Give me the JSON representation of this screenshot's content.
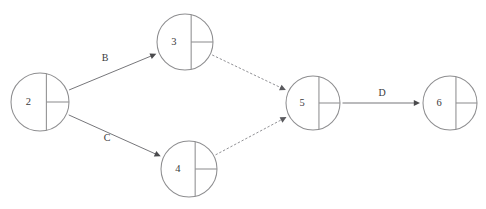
{
  "diagram": {
    "background_color": "#ffffff",
    "node_stroke_color": "#8e8e90",
    "edge_solid_color": "#6f6f73",
    "edge_dashed_color": "#8b8b8f",
    "label_color": "#3a3a3c",
    "nodes": [
      {
        "id": "2",
        "label": "2",
        "cx": 40,
        "cy": 102,
        "r": 29
      },
      {
        "id": "3",
        "label": "3",
        "cx": 185,
        "cy": 42,
        "r": 28
      },
      {
        "id": "4",
        "label": "4",
        "cx": 189,
        "cy": 169,
        "r": 28
      },
      {
        "id": "5",
        "label": "5",
        "cx": 313,
        "cy": 103,
        "r": 27
      },
      {
        "id": "6",
        "label": "6",
        "cx": 450,
        "cy": 103,
        "r": 27
      }
    ],
    "edges": [
      {
        "id": "edge-2-3",
        "from": "2",
        "to": "3",
        "label": "B",
        "style": "solid",
        "label_x": 105,
        "label_y": 59
      },
      {
        "id": "edge-2-4",
        "from": "2",
        "to": "4",
        "label": "C",
        "style": "solid",
        "label_x": 107,
        "label_y": 139
      },
      {
        "id": "edge-3-5",
        "from": "3",
        "to": "5",
        "label": "",
        "style": "dashed",
        "label_x": 250,
        "label_y": 63
      },
      {
        "id": "edge-4-5",
        "from": "4",
        "to": "5",
        "label": "",
        "style": "dashed",
        "label_x": 252,
        "label_y": 143
      },
      {
        "id": "edge-5-6",
        "from": "5",
        "to": "6",
        "label": "D",
        "style": "solid",
        "label_x": 382,
        "label_y": 94
      }
    ]
  }
}
